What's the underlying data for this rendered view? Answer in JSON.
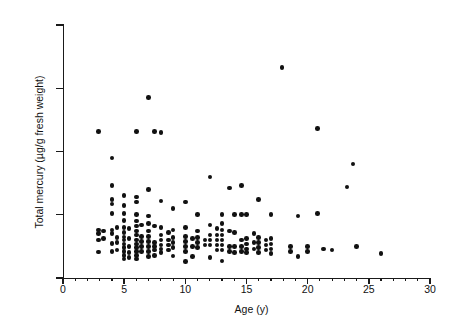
{
  "figure": {
    "background": "#ffffff",
    "point_color": "#111111",
    "axis_color": "#1a1a1a"
  },
  "chart_data": {
    "type": "scatter",
    "title": "",
    "xlabel": "Age (y)",
    "ylabel": "Total mercury (µg/g fresh weight)",
    "xlim": [
      0,
      30
    ],
    "ylim": [
      0,
      40
    ],
    "xticks": [
      0,
      5,
      10,
      15,
      20,
      25,
      30
    ],
    "yticks": [
      0,
      10,
      20,
      30,
      40
    ],
    "xtick_labels": [
      "0",
      "5",
      "10",
      "15",
      "20",
      "25",
      "30"
    ],
    "ytick_labels": [
      "0",
      "10",
      "20",
      "30",
      "40"
    ],
    "xminor_step": 1,
    "grid": false,
    "legend": null,
    "marker": "filled-circle",
    "marker_size_px": 4.6,
    "series": [
      {
        "name": "Total mercury vs age",
        "points": [
          [
            2.9,
            23.2
          ],
          [
            2.9,
            7.6
          ],
          [
            2.9,
            7.0
          ],
          [
            2.9,
            6.0
          ],
          [
            2.9,
            4.1
          ],
          [
            3.3,
            7.4
          ],
          [
            3.3,
            6.2
          ],
          [
            4.0,
            19.0
          ],
          [
            4.0,
            14.6
          ],
          [
            4.0,
            12.4
          ],
          [
            4.0,
            11.7
          ],
          [
            4.0,
            10.2
          ],
          [
            4.0,
            7.6
          ],
          [
            4.0,
            7.0
          ],
          [
            4.0,
            5.5
          ],
          [
            4.0,
            4.2
          ],
          [
            4.4,
            8.0
          ],
          [
            4.4,
            6.4
          ],
          [
            4.4,
            5.6
          ],
          [
            4.4,
            4.4
          ],
          [
            5.0,
            13.0
          ],
          [
            5.0,
            11.5
          ],
          [
            5.0,
            10.2
          ],
          [
            5.0,
            9.1
          ],
          [
            5.0,
            8.0
          ],
          [
            5.0,
            7.2
          ],
          [
            5.0,
            6.5
          ],
          [
            5.0,
            6.0
          ],
          [
            5.0,
            5.4
          ],
          [
            5.0,
            4.8
          ],
          [
            5.0,
            4.2
          ],
          [
            5.0,
            3.6
          ],
          [
            5.0,
            3.0
          ],
          [
            5.4,
            7.8
          ],
          [
            5.4,
            6.2
          ],
          [
            5.4,
            5.0
          ],
          [
            5.4,
            4.0
          ],
          [
            5.4,
            3.2
          ],
          [
            6.0,
            23.2
          ],
          [
            6.0,
            12.8
          ],
          [
            6.0,
            12.0
          ],
          [
            6.0,
            10.0
          ],
          [
            6.0,
            9.0
          ],
          [
            6.0,
            8.2
          ],
          [
            6.0,
            7.4
          ],
          [
            6.0,
            6.8
          ],
          [
            6.0,
            6.0
          ],
          [
            6.0,
            5.4
          ],
          [
            6.0,
            4.8
          ],
          [
            6.0,
            4.2
          ],
          [
            6.0,
            3.6
          ],
          [
            6.0,
            3.0
          ],
          [
            6.4,
            8.4
          ],
          [
            6.4,
            6.6
          ],
          [
            6.4,
            5.8
          ],
          [
            6.4,
            5.0
          ],
          [
            6.4,
            4.2
          ],
          [
            7.0,
            28.5
          ],
          [
            7.0,
            14.0
          ],
          [
            7.0,
            9.8
          ],
          [
            7.0,
            8.6
          ],
          [
            7.0,
            7.4
          ],
          [
            7.0,
            6.6
          ],
          [
            7.0,
            5.8
          ],
          [
            7.0,
            5.0
          ],
          [
            7.0,
            4.2
          ],
          [
            7.0,
            3.4
          ],
          [
            7.5,
            23.2
          ],
          [
            7.5,
            8.2
          ],
          [
            7.5,
            5.6
          ],
          [
            7.5,
            5.0
          ],
          [
            7.5,
            4.4
          ],
          [
            7.5,
            3.6
          ],
          [
            8.0,
            23.0
          ],
          [
            8.0,
            12.2
          ],
          [
            8.0,
            8.0
          ],
          [
            8.0,
            6.8
          ],
          [
            8.0,
            6.0
          ],
          [
            8.0,
            5.2
          ],
          [
            8.0,
            4.6
          ],
          [
            8.0,
            4.0
          ],
          [
            8.6,
            7.2
          ],
          [
            8.6,
            6.0
          ],
          [
            8.6,
            5.2
          ],
          [
            8.6,
            4.4
          ],
          [
            9.0,
            11.0
          ],
          [
            9.0,
            7.6
          ],
          [
            9.0,
            6.4
          ],
          [
            9.0,
            5.6
          ],
          [
            9.0,
            4.8
          ],
          [
            9.0,
            3.5
          ],
          [
            10.0,
            12.0
          ],
          [
            10.0,
            8.0
          ],
          [
            10.0,
            6.6
          ],
          [
            10.0,
            5.8
          ],
          [
            10.0,
            5.0
          ],
          [
            10.0,
            4.2
          ],
          [
            10.0,
            2.6
          ],
          [
            10.6,
            6.2
          ],
          [
            10.6,
            5.0
          ],
          [
            10.6,
            3.4
          ],
          [
            11.0,
            10.0
          ],
          [
            11.0,
            7.4
          ],
          [
            11.0,
            6.4
          ],
          [
            11.0,
            5.6
          ],
          [
            11.0,
            4.8
          ],
          [
            11.6,
            6.0
          ],
          [
            11.6,
            5.2
          ],
          [
            12.0,
            16.0
          ],
          [
            12.0,
            8.4
          ],
          [
            12.0,
            6.8
          ],
          [
            12.0,
            6.0
          ],
          [
            12.0,
            5.2
          ],
          [
            12.0,
            3.2
          ],
          [
            12.6,
            7.8
          ],
          [
            12.6,
            6.8
          ],
          [
            12.6,
            6.0
          ],
          [
            12.6,
            5.2
          ],
          [
            12.6,
            4.4
          ],
          [
            13.0,
            10.0
          ],
          [
            13.0,
            8.6
          ],
          [
            13.0,
            7.6
          ],
          [
            13.0,
            6.8
          ],
          [
            13.0,
            6.0
          ],
          [
            13.0,
            5.2
          ],
          [
            13.0,
            4.4
          ],
          [
            13.0,
            2.7
          ],
          [
            13.6,
            14.2
          ],
          [
            13.6,
            7.4
          ],
          [
            13.6,
            5.0
          ],
          [
            13.6,
            4.2
          ],
          [
            14.0,
            10.0
          ],
          [
            14.0,
            7.2
          ],
          [
            14.0,
            5.0
          ],
          [
            14.0,
            4.0
          ],
          [
            14.6,
            14.6
          ],
          [
            14.6,
            10.0
          ],
          [
            14.6,
            6.0
          ],
          [
            14.6,
            5.0
          ],
          [
            14.6,
            4.2
          ],
          [
            15.0,
            10.0
          ],
          [
            15.0,
            6.2
          ],
          [
            15.0,
            5.4
          ],
          [
            15.0,
            4.6
          ],
          [
            15.0,
            4.0
          ],
          [
            15.6,
            7.0
          ],
          [
            15.6,
            5.6
          ],
          [
            15.6,
            4.6
          ],
          [
            16.0,
            12.4
          ],
          [
            16.0,
            6.4
          ],
          [
            16.0,
            5.6
          ],
          [
            16.0,
            4.8
          ],
          [
            16.0,
            4.0
          ],
          [
            16.6,
            6.0
          ],
          [
            16.6,
            5.2
          ],
          [
            16.6,
            4.4
          ],
          [
            17.0,
            10.0
          ],
          [
            17.0,
            6.2
          ],
          [
            17.0,
            5.4
          ],
          [
            17.0,
            4.6
          ],
          [
            17.0,
            3.9
          ],
          [
            17.9,
            33.3
          ],
          [
            18.6,
            5.0
          ],
          [
            18.6,
            4.2
          ],
          [
            19.2,
            9.8
          ],
          [
            19.2,
            3.4
          ],
          [
            20.0,
            5.0
          ],
          [
            20.0,
            4.2
          ],
          [
            20.8,
            23.6
          ],
          [
            20.8,
            10.2
          ],
          [
            21.3,
            4.6
          ],
          [
            22.0,
            4.4
          ],
          [
            23.2,
            14.4
          ],
          [
            23.7,
            18.0
          ],
          [
            24.0,
            5.0
          ],
          [
            26.0,
            3.9
          ]
        ]
      }
    ]
  }
}
